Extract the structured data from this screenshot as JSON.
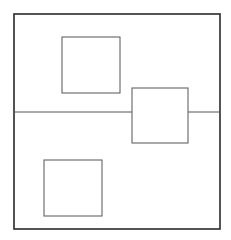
{
  "diagram": {
    "stroke_color": "#2a2a2a",
    "inner_stroke_color": "#555555",
    "outer_frame": {
      "x": 14,
      "y": 14,
      "w": 206,
      "h": 215
    },
    "divider": {
      "y": 112
    },
    "squares": [
      {
        "id": "top-left-square",
        "x": 62,
        "y": 37,
        "w": 58,
        "h": 56
      },
      {
        "id": "right-square",
        "x": 132,
        "y": 88,
        "w": 56,
        "h": 55
      },
      {
        "id": "bottom-left-square",
        "x": 44,
        "y": 160,
        "w": 58,
        "h": 56
      }
    ]
  }
}
